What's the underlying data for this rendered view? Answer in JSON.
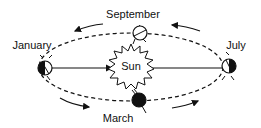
{
  "diagram": {
    "center_label": "Sun",
    "positions": {
      "top": "September",
      "left": "January",
      "right": "July",
      "bottom": "March"
    },
    "colors": {
      "line": "#111111",
      "background": "#ffffff"
    }
  }
}
